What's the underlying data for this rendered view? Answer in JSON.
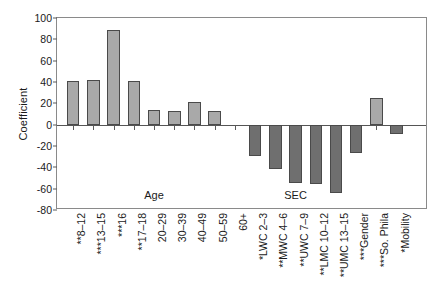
{
  "chart_data": {
    "type": "bar",
    "title": "",
    "xlabel": "",
    "ylabel": "Coefficient",
    "ylim": [
      -80,
      100
    ],
    "ytick_values": [
      100,
      80,
      60,
      40,
      20,
      0,
      -20,
      -40,
      -60,
      -80
    ],
    "ytick_labels": [
      "100",
      "80",
      "60",
      "40",
      "20",
      "0",
      "-20",
      "-40",
      "-60",
      "-80"
    ],
    "grid": false,
    "legend": "none",
    "categories": [
      "**8–12",
      "***13–15",
      "***16",
      "**17–18",
      "20–29",
      "30–39",
      "40–49",
      "50–59",
      "60+",
      "*LWC 2–3",
      "**MWC 4–6",
      "**UWC 7–9",
      "**LMC 10–12",
      "**UMC 13–15",
      "***Gender",
      "***So. Phila",
      "*Mobility"
    ],
    "values": [
      41,
      42,
      89,
      41,
      14,
      13,
      21,
      13,
      0,
      -29,
      -42,
      -55,
      -56,
      -64,
      -27,
      25,
      -9
    ],
    "groups": [
      {
        "label": "Age",
        "start_index": 0,
        "end_index": 8
      },
      {
        "label": "SEC",
        "start_index": 9,
        "end_index": 13
      }
    ],
    "bar_colors": {
      "positive": "#a9a9a9",
      "negative": "#6f6f6f",
      "edge": "#4a4a4a"
    }
  }
}
